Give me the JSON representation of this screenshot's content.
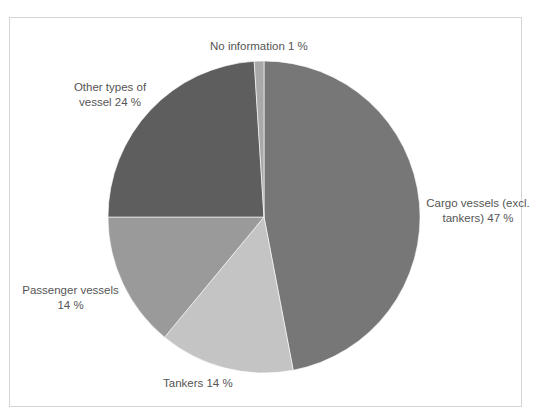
{
  "chart_data": {
    "type": "pie",
    "title": "",
    "start_angle_deg": 0,
    "direction": "clockwise",
    "slices": [
      {
        "label": "Cargo vessels (excl. tankers)",
        "value": 47,
        "display": "Cargo vessels (excl. tankers) 47 %",
        "color": "#777777"
      },
      {
        "label": "Tankers",
        "value": 14,
        "display": "Tankers 14 %",
        "color": "#c4c4c4"
      },
      {
        "label": "Passenger vessels",
        "value": 14,
        "display": "Passenger vessels 14 %",
        "color": "#9a9a9a"
      },
      {
        "label": "Other types of vessel",
        "value": 24,
        "display": "Other types of vessel 24 %",
        "color": "#5e5e5e"
      },
      {
        "label": "No information",
        "value": 1,
        "display": "No information 1 %",
        "color": "#a9a9a9"
      }
    ],
    "legend": "none",
    "unit": "%"
  },
  "labels": {
    "no_info": "No information 1 %",
    "other_line1": "Other types of",
    "other_line2": "vessel 24 %",
    "cargo_line1": "Cargo vessels (excl.",
    "cargo_line2": "tankers) 47 %",
    "passenger_line1": "Passenger vessels",
    "passenger_line2": "14 %",
    "tankers": "Tankers 14 %"
  }
}
